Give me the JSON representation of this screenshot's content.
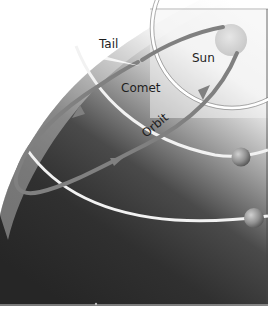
{
  "labels": {
    "tail": "Tail",
    "sun": "Sun",
    "comet": "Comet",
    "orbit": "Orbit"
  },
  "colors": {
    "background_light": "#ffffff",
    "space_dark": "#2b2b2b",
    "space_mid": "#8a8a8a",
    "planet_orbit": "#f2f2f2",
    "comet_orbit": "#808080",
    "sun": "#d6d6d6",
    "planet": "#9a9a9a",
    "label_text": "#1e1e1e"
  },
  "elements": {
    "sun": "sun",
    "comet": "comet",
    "planets": [
      "planet-1",
      "planet-2"
    ],
    "planet_orbits": [
      "inner-orbit",
      "middle-orbit",
      "outer-orbit"
    ]
  }
}
